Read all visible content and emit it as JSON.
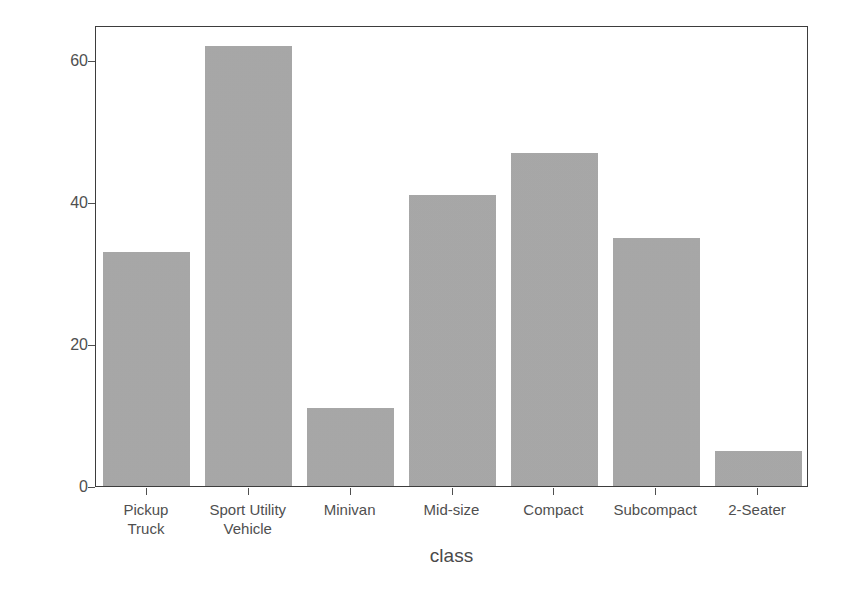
{
  "chart_data": {
    "type": "bar",
    "title": "",
    "subtitle": "",
    "xlabel": "class",
    "ylabel": "count",
    "categories": [
      "Pickup\nTruck",
      "Sport Utility\nVehicle",
      "Minivan",
      "Mid-size",
      "Compact",
      "Subcompact",
      "2-Seater"
    ],
    "values": [
      33,
      62,
      11,
      41,
      47,
      35,
      5
    ],
    "ylim": [
      0,
      65
    ],
    "y_ticks": [
      0,
      20,
      40,
      60
    ],
    "y_tick_labels": [
      "0",
      "20",
      "40",
      "60"
    ],
    "grid": false,
    "legend": "none",
    "bar_color": "#a9a9a9",
    "panel_border_color": "#3d3d3d",
    "axis_text_color": "#4f4f4f",
    "background_color": "#ffffff"
  }
}
